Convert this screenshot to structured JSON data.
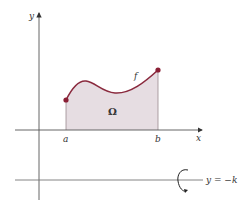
{
  "diagram": {
    "type": "solid-of-revolution-region",
    "labels": {
      "y_axis": "y",
      "x_axis": "x",
      "a": "a",
      "b": "b",
      "function": "f",
      "region": "Ω",
      "rotation_line": "y = −k"
    },
    "colors": {
      "curve": "#8a2a3e",
      "endpoint": "#8a1f35",
      "region_fill": "#e6dde2",
      "axes": "#555555",
      "text": "#333333"
    },
    "geometry": {
      "y_axis_x": 39,
      "x_axis_y": 130,
      "rotation_line_y": 180,
      "point_a": [
        66,
        100
      ],
      "point_b": [
        158,
        70
      ]
    }
  }
}
